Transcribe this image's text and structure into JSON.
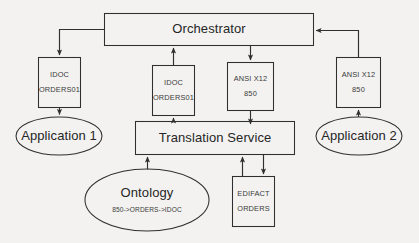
{
  "diagram": {
    "background_color": "#f3f2f0",
    "stroke_color": "#2f2f2f",
    "fill_color": "#f3f2f0",
    "nodes": {
      "orchestrator": {
        "label": "Orchestrator",
        "shape": "rectangle"
      },
      "idoc_left": {
        "line1": "IDOC",
        "line2": "ORDERS01",
        "shape": "rectangle"
      },
      "idoc_middle": {
        "line1": "IDOC",
        "line2": "ORDERS01",
        "shape": "rectangle"
      },
      "ansi_middle": {
        "line1": "ANSI X12",
        "line2": "850",
        "shape": "rectangle"
      },
      "ansi_right": {
        "line1": "ANSI X12",
        "line2": "850",
        "shape": "rectangle"
      },
      "application_1": {
        "label": "Application 1",
        "shape": "ellipse"
      },
      "application_2": {
        "label": "Application 2",
        "shape": "ellipse"
      },
      "translation_service": {
        "label": "Translation Service",
        "shape": "rectangle"
      },
      "ontology": {
        "label": "Ontology",
        "mapping": "850->ORDERS->IDOC",
        "shape": "ellipse"
      },
      "edifact": {
        "line1": "EDIFACT",
        "line2": "ORDERS",
        "shape": "rectangle"
      }
    },
    "edges": [
      {
        "from": "orchestrator",
        "to": "idoc_left",
        "direction": "down"
      },
      {
        "from": "idoc_left",
        "to": "application_1",
        "direction": "down"
      },
      {
        "from": "idoc_middle",
        "to": "orchestrator",
        "direction": "up"
      },
      {
        "from": "translation_service",
        "to": "idoc_middle",
        "direction": "up"
      },
      {
        "from": "orchestrator",
        "to": "ansi_middle",
        "direction": "down"
      },
      {
        "from": "ansi_middle",
        "to": "translation_service",
        "direction": "down"
      },
      {
        "from": "ansi_right",
        "to": "orchestrator",
        "direction": "up-left"
      },
      {
        "from": "application_2",
        "to": "ansi_right",
        "direction": "up"
      },
      {
        "from": "ontology",
        "to": "translation_service",
        "direction": "up"
      },
      {
        "from": "edifact",
        "to": "translation_service",
        "direction": "up"
      },
      {
        "from": "translation_service",
        "to": "edifact",
        "direction": "down"
      }
    ]
  }
}
